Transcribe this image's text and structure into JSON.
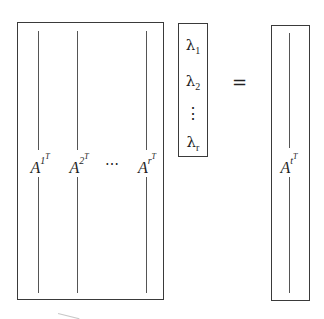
{
  "diagram": {
    "type": "matrix-equation",
    "left_matrix": {
      "columns": [
        {
          "base": "A",
          "sup": "1",
          "supsup": "T"
        },
        {
          "base": "A",
          "sup": "2",
          "supsup": "T"
        },
        {
          "base": "A",
          "sup": "r",
          "supsup": "T"
        }
      ],
      "ellipsis": "⋯"
    },
    "vector": {
      "entries": [
        {
          "base": "λ",
          "sub": "1"
        },
        {
          "base": "λ",
          "sub": "2"
        },
        {
          "base": "λ",
          "sub": "r"
        }
      ],
      "vdots": "⋮"
    },
    "equals": "=",
    "result": {
      "base": "A",
      "sup": "t",
      "supsup": "T"
    }
  }
}
